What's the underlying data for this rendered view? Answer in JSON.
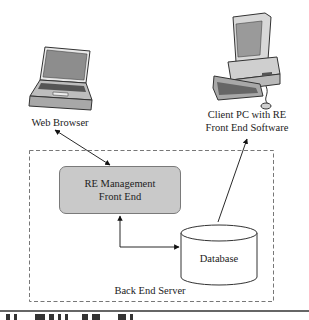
{
  "nodes": {
    "web_browser": {
      "label": "Web Browser",
      "icon": "laptop-icon"
    },
    "client_pc": {
      "label_line1": "Client PC with RE",
      "label_line2": "Front End Software",
      "icon": "desktop-computer-icon"
    },
    "re_management": {
      "label_line1": "RE Management",
      "label_line2": "Front End",
      "fill": "#c9c9c9"
    },
    "database": {
      "label": "Database",
      "icon": "database-cylinder"
    }
  },
  "container": {
    "label": "Back End Server",
    "style": "dashed"
  },
  "edges": [
    {
      "from": "web_browser",
      "to": "re_management",
      "type": "bidirectional-arrow"
    },
    {
      "from": "re_management",
      "to": "database",
      "type": "bidirectional-elbow-arrow"
    },
    {
      "from": "database",
      "to": "client_pc",
      "type": "arrow"
    }
  ],
  "colors": {
    "line": "#222222",
    "dash": "#777777",
    "box_fill": "#c9c9c9",
    "rule": "#333333"
  }
}
